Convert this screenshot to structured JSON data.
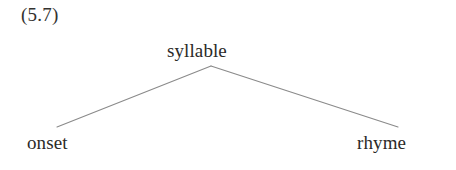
{
  "figure": {
    "example_number": "(5.7)",
    "type": "syntax-tree-diagram",
    "background_color": "#ffffff",
    "text_color": "#2b2a28",
    "edge_color": "#8a8a8a"
  },
  "tree": {
    "root": {
      "label": "syllable",
      "x": 211,
      "y": 60
    },
    "children": [
      {
        "label": "onset",
        "x": 59,
        "y": 152,
        "position": "left"
      },
      {
        "label": "rhyme",
        "x": 391,
        "y": 152,
        "position": "right"
      }
    ],
    "edges": [
      {
        "from": "syllable",
        "to": "onset",
        "x1": 211,
        "y1": 66,
        "x2": 57,
        "y2": 127
      },
      {
        "from": "syllable",
        "to": "rhyme",
        "x1": 211,
        "y1": 66,
        "x2": 398,
        "y2": 127
      }
    ]
  }
}
